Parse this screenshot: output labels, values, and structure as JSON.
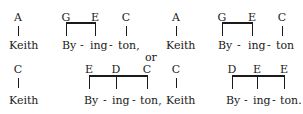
{
  "row1": {
    "left": {
      "keith_note": "A",
      "byington_notes": [
        "G",
        "E"
      ],
      "ton_note": "C",
      "keith": "Keith",
      "by": "By",
      "dash1": "-",
      "ing": "ing",
      "dash2": "-",
      "ton": "ton,"
    },
    "right": {
      "keith_note": "A",
      "byington_notes": [
        "G",
        "E"
      ],
      "ton_note": "C",
      "keith": "Keith",
      "by": "By",
      "dash1": "-",
      "ing": "ing",
      "dash2": "-",
      "ton": "ton"
    }
  },
  "separator": "or",
  "row2": {
    "left": {
      "keith_note": "C",
      "byington_notes": [
        "E",
        "D",
        "C"
      ],
      "keith": "Keith",
      "by": "By",
      "dash1": "-",
      "ing": "ing",
      "dash2": "-",
      "ton": "ton,"
    },
    "right": {
      "keith_note": "C",
      "byington_notes": [
        "D",
        "E",
        "E"
      ],
      "keith": "Keith",
      "by": "By",
      "dash1": "-",
      "ing": "ing",
      "dash2": "-",
      "ton": "ton."
    }
  }
}
